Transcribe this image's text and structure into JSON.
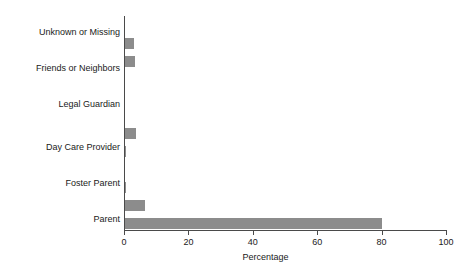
{
  "chart_data": {
    "type": "bar",
    "orientation": "horizontal",
    "title": "",
    "xlabel": "Percentage",
    "ylabel": "",
    "xlim": [
      0,
      100
    ],
    "xticks": [
      0,
      20,
      40,
      60,
      80,
      100
    ],
    "grid": false,
    "legend": "none",
    "bar_color": "#8c8c8c",
    "axis_color": "#4a4a4a",
    "categories": [
      "Parent",
      "Foster Parent",
      "Day Care Provider",
      "Legal Guardian",
      "Friends or Neighbors",
      "Unknown or Missing"
    ],
    "series": [
      {
        "name": "Series 1",
        "values": [
          80.0,
          0.6,
          0.6,
          0.3,
          0.4,
          3.0
        ]
      },
      {
        "name": "Series 2",
        "values": [
          6.6,
          0.3,
          3.6,
          0.3,
          0.3,
          3.4
        ]
      }
    ],
    "bars_bottom_to_top": [
      {
        "category": "Parent",
        "series": "Series 1",
        "value": 80.0
      },
      {
        "category": "Parent",
        "series": "Series 2",
        "value": 6.6
      },
      {
        "category": "Foster Parent",
        "series": "Series 1",
        "value": 0.6
      },
      {
        "category": "Foster Parent",
        "series": "Series 2",
        "value": 0.3
      },
      {
        "category": "Day Care Provider",
        "series": "Series 1",
        "value": 0.6
      },
      {
        "category": "Day Care Provider",
        "series": "Series 2",
        "value": 3.6
      },
      {
        "category": "Legal Guardian",
        "series": "Series 1",
        "value": 0.3
      },
      {
        "category": "Legal Guardian",
        "series": "Series 2",
        "value": 0.3
      },
      {
        "category": "Friends or Neighbors",
        "series": "Series 1",
        "value": 0.4
      },
      {
        "category": "Friends or Neighbors",
        "series": "Series 2",
        "value": 3.4
      },
      {
        "category": "Unknown or Missing",
        "series": "Series 1",
        "value": 3.0
      }
    ]
  },
  "axis": {
    "x_title": "Percentage",
    "tick_labels": [
      "0",
      "20",
      "40",
      "60",
      "80",
      "100"
    ]
  },
  "labels": {
    "unknown_or_missing": "Unknown or Missing",
    "friends_or_neighbors": "Friends or Neighbors",
    "legal_guardian": "Legal Guardian",
    "day_care_provider": "Day Care Provider",
    "foster_parent": "Foster Parent",
    "parent": "Parent"
  }
}
